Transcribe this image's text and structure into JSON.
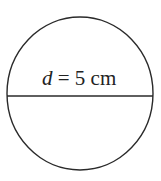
{
  "diagram": {
    "shape": "circle",
    "label": {
      "variable": "d",
      "equals": " = ",
      "value": "5",
      "unit": " cm"
    },
    "colors": {
      "stroke": "#2a2a2a",
      "text": "#222222",
      "background": "#ffffff"
    }
  }
}
